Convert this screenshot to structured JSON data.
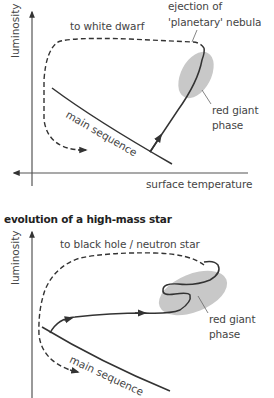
{
  "top_diagram": {
    "y_axis_label": "luminosity",
    "x_axis_label": "surface temperature",
    "labels": {
      "path_to_remnant": "to white dwarf",
      "ejection_line1": "ejection of",
      "ejection_line2": "'planetary' nebula",
      "red_giant_line1": "red giant",
      "red_giant_line2": "phase",
      "main_sequence": "main sequence"
    }
  },
  "bottom_diagram": {
    "title": "evolution of a high-mass star",
    "y_axis_label": "luminosity",
    "labels": {
      "path_to_remnant": "to black hole / neutron star",
      "red_giant_line1": "red giant",
      "red_giant_line2": "phase",
      "main_sequence": "main sequence"
    }
  },
  "colors": {
    "line": "#333333",
    "ellipse_fill": "#c8c8c8",
    "text": "#444444"
  }
}
